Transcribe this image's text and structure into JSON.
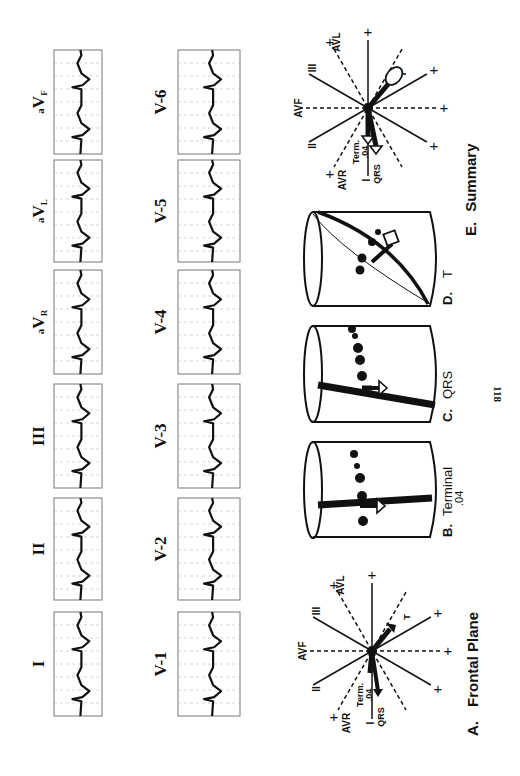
{
  "page": {
    "page_number": "118",
    "orientation": "rotated-90-ccw"
  },
  "limb_leads": {
    "row_label": "Limb and augmented leads",
    "leads": [
      {
        "label": "I",
        "style": "roman"
      },
      {
        "label": "II",
        "style": "roman"
      },
      {
        "label": "III",
        "style": "roman"
      },
      {
        "label": "aVR",
        "prefix": "a",
        "main": "V",
        "sub": "R"
      },
      {
        "label": "aVL",
        "prefix": "a",
        "main": "V",
        "sub": "L"
      },
      {
        "label": "aVF",
        "prefix": "a",
        "main": "V",
        "sub": "F"
      }
    ]
  },
  "precordial_leads": {
    "row_label": "Precordial leads",
    "leads": [
      {
        "label": "V-1"
      },
      {
        "label": "V-2"
      },
      {
        "label": "V-3"
      },
      {
        "label": "V-4"
      },
      {
        "label": "V-5"
      },
      {
        "label": "V-6"
      }
    ]
  },
  "panels": {
    "A": {
      "letter": "A.",
      "title": "Frontal Plane"
    },
    "B": {
      "letter": "B.",
      "title": "Terminal",
      "subtitle": ".04"
    },
    "C": {
      "letter": "C.",
      "title": "QRS"
    },
    "D": {
      "letter": "D.",
      "title": "T"
    },
    "E": {
      "letter": "E.",
      "title": "Summary"
    }
  },
  "axis_labels": {
    "avf": "AVF",
    "avl": "AVL",
    "avr": "AVR",
    "lead_i": "I",
    "lead_ii": "II",
    "lead_iii": "III",
    "plus": "+",
    "term": "Term.",
    "term_value": ".04",
    "qrs": "QRS",
    "t": "T"
  }
}
